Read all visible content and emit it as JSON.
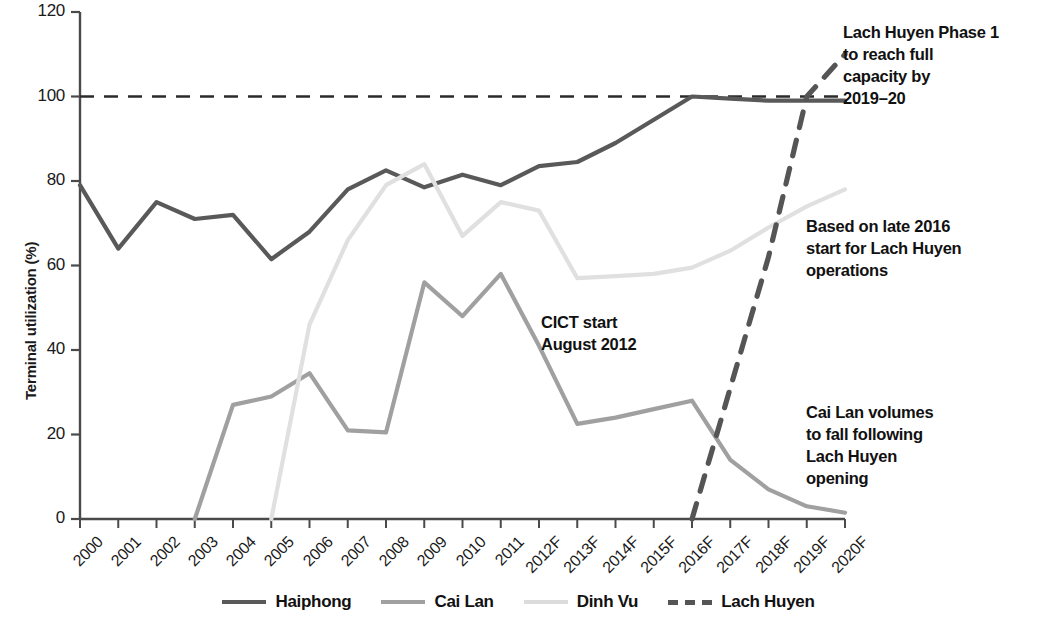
{
  "chart_data": {
    "type": "line",
    "title": "",
    "xlabel": "",
    "ylabel": "Terminal utilization (%)",
    "ylim": [
      0,
      120
    ],
    "yticks": [
      0,
      20,
      40,
      60,
      80,
      100,
      120
    ],
    "ytick_labels": [
      "0",
      "20",
      "40",
      "60",
      "80",
      "100",
      "120"
    ],
    "grid": false,
    "legend_position": "bottom",
    "categories": [
      "2000",
      "2001",
      "2002",
      "2003",
      "2004",
      "2005",
      "2006",
      "2007",
      "2008",
      "2009",
      "2010",
      "2011",
      "2012F",
      "2013F",
      "2014F",
      "2015F",
      "2016F",
      "2017F",
      "2018F",
      "2019F",
      "2020F"
    ],
    "series": [
      {
        "name": "Haiphong",
        "color": "#595959",
        "style": "solid",
        "values": [
          79,
          64,
          75,
          71,
          72,
          61.5,
          68,
          78,
          82.5,
          78.5,
          81.5,
          79,
          83.5,
          84.5,
          89,
          94.5,
          100,
          99.5,
          99,
          99,
          99
        ]
      },
      {
        "name": "Cai Lan",
        "color": "#a0a0a0",
        "style": "solid",
        "values": [
          null,
          null,
          null,
          0,
          27,
          29,
          34.5,
          21,
          20.5,
          56,
          48,
          58,
          41,
          22.5,
          24,
          26,
          28,
          14,
          7,
          3,
          1.5
        ]
      },
      {
        "name": "Dinh Vu",
        "color": "#e0e0e0",
        "style": "solid",
        "values": [
          null,
          null,
          null,
          null,
          null,
          0,
          46,
          66,
          79,
          84,
          67,
          75,
          73,
          57,
          57.5,
          58,
          59.5,
          63.5,
          69,
          74,
          78
        ]
      },
      {
        "name": "Lach Huyen",
        "color": "#555555",
        "style": "dashed",
        "values": [
          null,
          null,
          null,
          null,
          null,
          null,
          null,
          null,
          null,
          null,
          null,
          null,
          null,
          null,
          null,
          null,
          0,
          31,
          62,
          100,
          110
        ]
      }
    ],
    "reference_lines": [
      {
        "name": "full-capacity-line",
        "y": 100,
        "style": "dashed",
        "color": "#2b2b2b"
      }
    ],
    "annotations": [
      {
        "name": "lach-huyen-capacity-note",
        "lines": [
          "Lach Huyen Phase 1",
          "to reach full",
          "capacity by",
          "2019–20"
        ]
      },
      {
        "name": "lach-huyen-start-note",
        "lines": [
          "Based on late 2016",
          "start for Lach Huyen",
          "operations"
        ]
      },
      {
        "name": "cai-lan-decline-note",
        "lines": [
          "Cai Lan volumes",
          "to fall following",
          "Lach Huyen",
          "opening"
        ]
      },
      {
        "name": "cict-start-note",
        "lines": [
          "CICT start",
          "August 2012"
        ]
      }
    ]
  },
  "axis": {
    "y_title": "Terminal utilization (%)",
    "y_labels": [
      "120",
      "100",
      "80",
      "60",
      "40",
      "20",
      "0"
    ],
    "x_labels": [
      "2000",
      "2001",
      "2002",
      "2003",
      "2004",
      "2005",
      "2006",
      "2007",
      "2008",
      "2009",
      "2010",
      "2011",
      "2012F",
      "2013F",
      "2014F",
      "2015F",
      "2016F",
      "2017F",
      "2018F",
      "2019F",
      "2020F"
    ]
  },
  "legend": {
    "items": [
      {
        "label": "Haiphong",
        "color": "#595959",
        "style": "solid"
      },
      {
        "label": "Cai Lan",
        "color": "#a0a0a0",
        "style": "solid"
      },
      {
        "label": "Dinh Vu",
        "color": "#dcdcdc",
        "style": "solid"
      },
      {
        "label": "Lach Huyen",
        "color": "#555555",
        "style": "dashed"
      }
    ]
  },
  "annotations": {
    "capacity": {
      "l1": "Lach Huyen Phase 1",
      "l2": "to reach full",
      "l3": "capacity by",
      "l4": "2019–20"
    },
    "start": {
      "l1": "Based on late 2016",
      "l2": "start for Lach Huyen",
      "l3": "operations"
    },
    "cailan": {
      "l1": "Cai Lan volumes",
      "l2": "to fall following",
      "l3": "Lach Huyen",
      "l4": "opening"
    },
    "cict": {
      "l1": "CICT start",
      "l2": "August 2012"
    }
  }
}
